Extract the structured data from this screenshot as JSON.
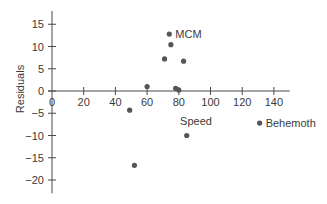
{
  "chart_data": {
    "type": "scatter",
    "title": "",
    "xlabel": "Speed",
    "ylabel": "Residuals",
    "xlim": [
      0,
      150
    ],
    "ylim": [
      -23,
      18
    ],
    "xticks": [
      0,
      20,
      40,
      60,
      80,
      100,
      120,
      140
    ],
    "yticks": [
      15,
      10,
      5,
      0,
      -5,
      -10,
      -15,
      -20
    ],
    "grid": false,
    "legend": null,
    "point_color": "#555555",
    "points": [
      {
        "x": 74,
        "y": 12.8,
        "label": "MCM"
      },
      {
        "x": 75,
        "y": 10.4,
        "label": ""
      },
      {
        "x": 71,
        "y": 7.2,
        "label": ""
      },
      {
        "x": 83,
        "y": 6.7,
        "label": ""
      },
      {
        "x": 60,
        "y": 1.0,
        "label": ""
      },
      {
        "x": 78,
        "y": 0.6,
        "label": ""
      },
      {
        "x": 80,
        "y": 0.2,
        "label": ""
      },
      {
        "x": 49,
        "y": -4.3,
        "label": ""
      },
      {
        "x": 85,
        "y": -10.0,
        "label": ""
      },
      {
        "x": 52,
        "y": -16.7,
        "label": ""
      },
      {
        "x": 131,
        "y": -7.2,
        "label": "Behemoth"
      }
    ],
    "annotations": [
      "MCM",
      "Behemoth"
    ]
  }
}
